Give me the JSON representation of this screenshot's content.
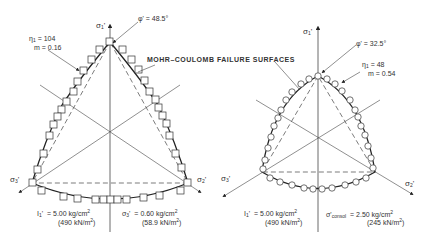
{
  "title_label": "MOHR–COULOMB FAILURE SURFACES",
  "left": {
    "axis_labels": {
      "s1": "σ",
      "s1_sub": "1",
      "s2": "σ",
      "s2_sub": "2",
      "s3": "σ",
      "s3_sub": "3"
    },
    "phi": "φ' = 48.5°",
    "eta_label": "η",
    "eta_sub": "1",
    "eta_value": "= 104",
    "m_label": "m",
    "m_value": "= 0.16",
    "i1_label": "I",
    "i1_sub": "1",
    "i1_value": "= 5.00 kg/cm",
    "i1_sup": "2",
    "i1_si": "(490 kN/m",
    "i1_si_sup": "2",
    "i1_si_end": ")",
    "param_label": "σ",
    "param_sub": "3",
    "param_value": "= 0.60 kg/cm",
    "param_sup": "2",
    "param_si": "(58.9 kN/m",
    "param_si_sup": "2",
    "param_si_end": ")",
    "marker": "square"
  },
  "right": {
    "axis_labels": {
      "s1": "σ",
      "s1_sub": "1",
      "s2": "σ",
      "s2_sub": "2",
      "s3": "σ",
      "s3_sub": "3"
    },
    "phi": "φ' = 32.5°",
    "eta_label": "η",
    "eta_sub": "1",
    "eta_value": "= 48",
    "m_label": "m",
    "m_value": "= 0.54",
    "i1_label": "I",
    "i1_sub": "1",
    "i1_value": "= 5.00 kg/cm",
    "i1_sup": "2",
    "i1_si": "(490 kN/m",
    "i1_si_sup": "2",
    "i1_si_end": ")",
    "param_label": "σ'",
    "param_sub": "consol",
    "param_value": "= 2.50 kg/cm",
    "param_sup": "2",
    "param_si": "(245 kN/m",
    "param_si_sup": "2",
    "param_si_end": ")",
    "marker": "circle"
  },
  "colors": {
    "line": "#333333",
    "dash": "#555555",
    "marker_fill": "#ffffff"
  }
}
